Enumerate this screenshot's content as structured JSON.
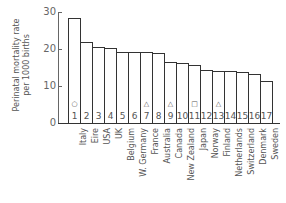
{
  "chart_data": {
    "type": "bar",
    "title": "",
    "ylabel": "Perinatal mortality rate per 1000 births",
    "xlabel": "",
    "ylim": [
      0,
      30
    ],
    "yticks": [
      0,
      10,
      20,
      30
    ],
    "grid": false,
    "categories": [
      "Italy",
      "Eire",
      "USA",
      "UK",
      "Belgium",
      "W. Germany",
      "France",
      "Australia",
      "Canada",
      "New Zealand",
      "Japan",
      "Norway",
      "Finland",
      "Netherlands",
      "Switzerland",
      "Denmark",
      "Sweden"
    ],
    "bar_numbers": [
      "1",
      "2",
      "3",
      "4",
      "5",
      "6",
      "7",
      "8",
      "9",
      "10",
      "11",
      "12",
      "13",
      "14",
      "15",
      "16",
      "17"
    ],
    "values": [
      28.5,
      22.0,
      20.5,
      20.2,
      19.2,
      19.2,
      19.2,
      18.9,
      16.5,
      16.2,
      15.7,
      14.3,
      14.1,
      14.1,
      13.8,
      13.2,
      11.4
    ],
    "markers": [
      "circle",
      "",
      "",
      "",
      "",
      "",
      "triangle",
      "",
      "triangle",
      "",
      "square",
      "",
      "triangle",
      "",
      "",
      "",
      ""
    ],
    "annotations": [
      "○ above bar 1",
      "△ above bars 7, 9, 13",
      "□ above bar 11"
    ]
  },
  "ylabel_lines": [
    "Perinatal mortality rate",
    "per 1000 births"
  ],
  "ytick_labels": [
    "0",
    "10",
    "20",
    "30"
  ],
  "marker_glyphs": {
    "circle": "○",
    "triangle": "△",
    "square": "□"
  }
}
